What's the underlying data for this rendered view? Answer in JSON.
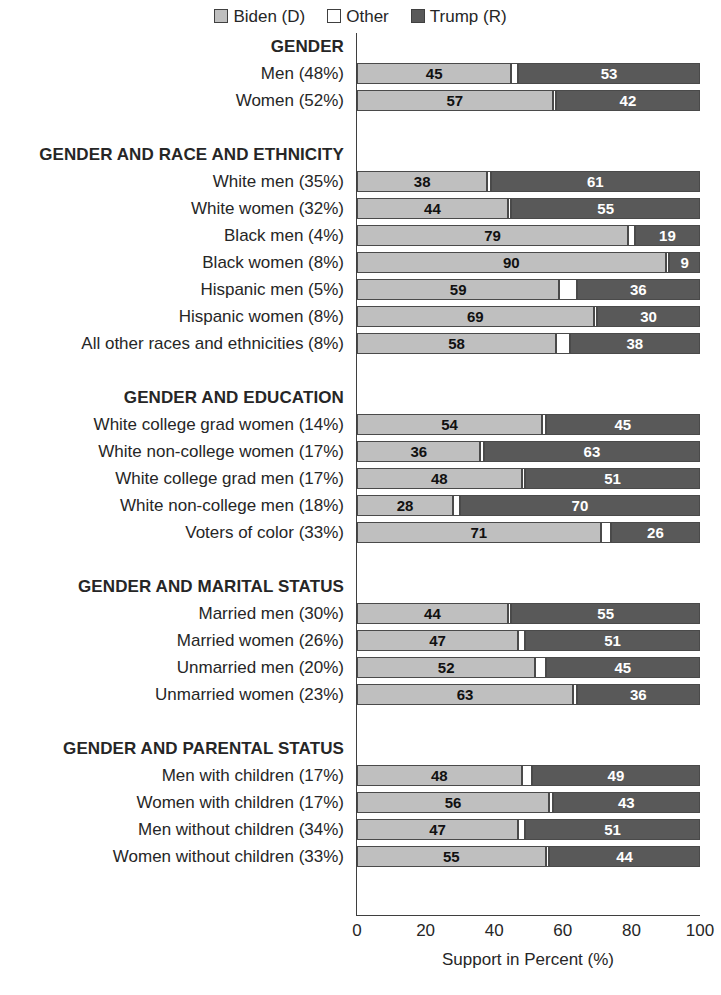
{
  "legend": {
    "entries": [
      {
        "label": "Biden (D)",
        "color": "#bfbfbf",
        "key": "biden"
      },
      {
        "label": "Other",
        "color": "#ffffff",
        "key": "other"
      },
      {
        "label": "Trump (R)",
        "color": "#595959",
        "key": "trump"
      }
    ]
  },
  "axis": {
    "title": "Support in Percent (%)",
    "ticks": [
      "0",
      "20",
      "40",
      "60",
      "80",
      "100"
    ]
  },
  "chart_data": {
    "type": "bar",
    "subtype": "stacked-horizontal-bar",
    "title": "",
    "xlabel": "Support in Percent (%)",
    "ylabel": "",
    "xlim": [
      0,
      100
    ],
    "xticks": [
      0,
      20,
      40,
      60,
      80,
      100
    ],
    "grid": false,
    "legend_position": "top-center",
    "series": [
      {
        "name": "Biden (D)",
        "color": "#bfbfbf"
      },
      {
        "name": "Other",
        "color": "#ffffff"
      },
      {
        "name": "Trump (R)",
        "color": "#595959"
      }
    ],
    "sections": [
      {
        "header": "GENDER",
        "rows": [
          {
            "label": "Men (48%)",
            "biden": 45,
            "other": 2,
            "trump": 53
          },
          {
            "label": "Women (52%)",
            "biden": 57,
            "other": 1,
            "trump": 42
          }
        ]
      },
      {
        "header": "GENDER AND RACE AND ETHNICITY",
        "rows": [
          {
            "label": "White men (35%)",
            "biden": 38,
            "other": 1,
            "trump": 61
          },
          {
            "label": "White women (32%)",
            "biden": 44,
            "other": 1,
            "trump": 55
          },
          {
            "label": "Black men (4%)",
            "biden": 79,
            "other": 2,
            "trump": 19
          },
          {
            "label": "Black women (8%)",
            "biden": 90,
            "other": 1,
            "trump": 9
          },
          {
            "label": "Hispanic men (5%)",
            "biden": 59,
            "other": 5,
            "trump": 36
          },
          {
            "label": "Hispanic women (8%)",
            "biden": 69,
            "other": 1,
            "trump": 30
          },
          {
            "label": "All other races and ethnicities (8%)",
            "biden": 58,
            "other": 4,
            "trump": 38
          }
        ]
      },
      {
        "header": "GENDER AND EDUCATION",
        "rows": [
          {
            "label": "White college grad women (14%)",
            "biden": 54,
            "other": 1,
            "trump": 45
          },
          {
            "label": "White non-college women (17%)",
            "biden": 36,
            "other": 1,
            "trump": 63
          },
          {
            "label": "White college grad men (17%)",
            "biden": 48,
            "other": 1,
            "trump": 51
          },
          {
            "label": "White non-college men (18%)",
            "biden": 28,
            "other": 2,
            "trump": 70
          },
          {
            "label": "Voters of color (33%)",
            "biden": 71,
            "other": 3,
            "trump": 26
          }
        ]
      },
      {
        "header": "GENDER AND MARITAL STATUS",
        "rows": [
          {
            "label": "Married men (30%)",
            "biden": 44,
            "other": 1,
            "trump": 55
          },
          {
            "label": "Married women (26%)",
            "biden": 47,
            "other": 2,
            "trump": 51
          },
          {
            "label": "Unmarried men (20%)",
            "biden": 52,
            "other": 3,
            "trump": 45
          },
          {
            "label": "Unmarried women (23%)",
            "biden": 63,
            "other": 1,
            "trump": 36
          }
        ]
      },
      {
        "header": "GENDER AND PARENTAL STATUS",
        "rows": [
          {
            "label": "Men with children (17%)",
            "biden": 48,
            "other": 3,
            "trump": 49
          },
          {
            "label": "Women with children (17%)",
            "biden": 56,
            "other": 1,
            "trump": 43
          },
          {
            "label": "Men without children (34%)",
            "biden": 47,
            "other": 2,
            "trump": 51
          },
          {
            "label": "Women without children (33%)",
            "biden": 55,
            "other": 1,
            "trump": 44
          }
        ]
      }
    ]
  }
}
